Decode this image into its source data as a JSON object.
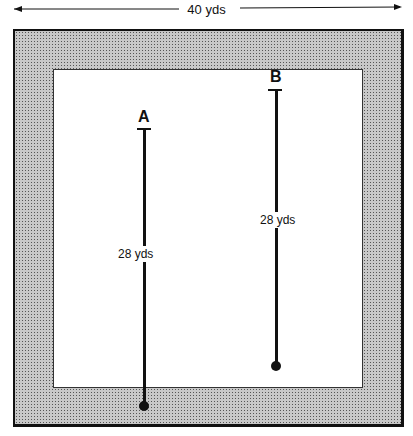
{
  "diagram": {
    "width_label": "40 yds",
    "players": [
      {
        "label": "A",
        "distance_label": "28 yds"
      },
      {
        "label": "B",
        "distance_label": "28 yds"
      }
    ],
    "colors": {
      "ink": "#111111",
      "shaded_border": "#c8c8c8",
      "field": "#ffffff"
    }
  }
}
